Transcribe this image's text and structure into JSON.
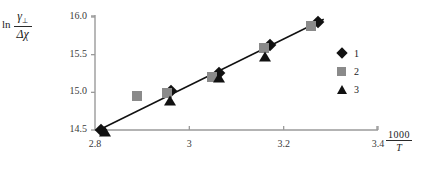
{
  "chart_data": {
    "type": "scatter",
    "title": "",
    "ylabel_parts": {
      "ln": "ln",
      "numerator": "γ",
      "numerator_sub": "⊥",
      "denominator": "Δχ"
    },
    "xlabel_parts": {
      "numerator": "1000",
      "denominator": "T"
    },
    "xlim": [
      2.8,
      3.4
    ],
    "ylim": [
      14.5,
      16.0
    ],
    "xticks": [
      "2.8",
      "3",
      "3.2",
      "3.4"
    ],
    "xtick_values": [
      2.8,
      3.0,
      3.2,
      3.4
    ],
    "yticks": [
      "14.5",
      "15.0",
      "15.5",
      "16.0"
    ],
    "ytick_values": [
      14.5,
      15.0,
      15.5,
      16.0
    ],
    "grid": false,
    "legend_position": "right",
    "trendline": {
      "x": [
        2.805,
        3.285
      ],
      "y": [
        14.49,
        15.97
      ]
    },
    "series": [
      {
        "name": "1",
        "marker": "diamond",
        "color": "#111111",
        "points": [
          {
            "x": 2.812,
            "y": 14.505
          },
          {
            "x": 2.962,
            "y": 15.015
          },
          {
            "x": 3.063,
            "y": 15.255
          },
          {
            "x": 3.172,
            "y": 15.625
          },
          {
            "x": 3.272,
            "y": 15.935
          }
        ]
      },
      {
        "name": "2",
        "marker": "square",
        "color": "#8a8a8a",
        "points": [
          {
            "x": 2.888,
            "y": 14.955
          },
          {
            "x": 2.952,
            "y": 14.995
          },
          {
            "x": 3.048,
            "y": 15.205
          },
          {
            "x": 3.158,
            "y": 15.585
          },
          {
            "x": 3.258,
            "y": 15.885
          }
        ]
      },
      {
        "name": "3",
        "marker": "triangle",
        "color": "#111111",
        "points": [
          {
            "x": 2.822,
            "y": 14.475
          },
          {
            "x": 2.958,
            "y": 14.885
          },
          {
            "x": 3.062,
            "y": 15.185
          },
          {
            "x": 3.16,
            "y": 15.475
          }
        ]
      }
    ]
  },
  "legend": {
    "entries": [
      {
        "label": "1",
        "marker": "diamond-marker"
      },
      {
        "label": "2",
        "marker": "square-marker"
      },
      {
        "label": "3",
        "marker": "triangle-marker"
      }
    ]
  },
  "colors": {
    "series1": "#111111",
    "series2": "#8a8a8a",
    "series3": "#111111",
    "axis": "#9a9a9a",
    "trendline": "#111111"
  }
}
